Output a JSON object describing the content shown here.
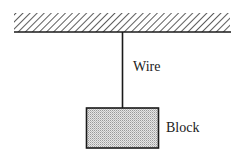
{
  "diagram": {
    "labels": {
      "wire": "Wire",
      "block": "Block"
    },
    "components": [
      "ceiling",
      "wire",
      "block"
    ],
    "colors": {
      "line": "#1a1a1a",
      "hatch": "#333333",
      "block_fill": "#cfcfcf"
    }
  }
}
